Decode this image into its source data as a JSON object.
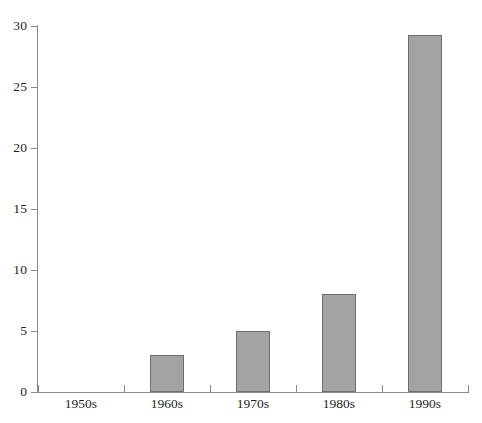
{
  "chart_data": {
    "type": "bar",
    "title": "",
    "subtitle": "",
    "xlabel": "",
    "ylabel": "",
    "categories": [
      "1950s",
      "1960s",
      "1970s",
      "1980s",
      "1990s"
    ],
    "values": [
      0,
      3,
      5,
      8,
      29.3
    ],
    "ylim": [
      0,
      30
    ],
    "yticks": [
      0,
      5,
      10,
      15,
      20,
      25,
      30
    ],
    "ytick_labels": [
      "0",
      "5",
      "10",
      "15",
      "20",
      "25",
      "30"
    ],
    "grid": false,
    "legend": null,
    "annotations": [],
    "colors": {
      "bar_fill": "#a3a3a3",
      "bar_border": "#6e6e6e",
      "axis": "#8a8a8a",
      "text": "#231f20",
      "background": "#ffffff"
    }
  }
}
